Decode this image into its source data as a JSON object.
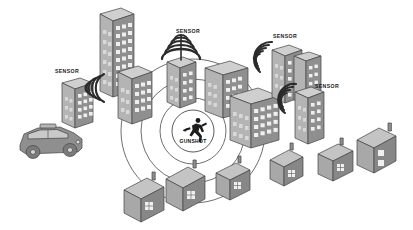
{
  "figure": {
    "background_color": "#ffffff",
    "stroke_color": "#3f3f3f",
    "fill_mid": "#9a9a9a",
    "fill_light": "#c2c2c2",
    "fill_dark": "#7d7d7d",
    "width": 413,
    "height": 230
  },
  "center_event": {
    "label": "GUNSHOT",
    "icon": "running-figure-icon",
    "x": 193,
    "y": 131,
    "badge_radius": 21
  },
  "ripples": {
    "count": 4,
    "radii": [
      21,
      33,
      52,
      72
    ],
    "center_x": 193,
    "center_y": 131
  },
  "sensors": [
    {
      "id": "sensor-left",
      "label": "SENSOR",
      "label_x": 55,
      "label_y": 71,
      "node_x": 100,
      "node_y": 87,
      "wave_direction": "left",
      "waves": 5,
      "type": "wave-fan"
    },
    {
      "id": "sensor-top-center",
      "label": "SENSOR",
      "label_x": 176,
      "label_y": 31,
      "node_x": 179,
      "node_y": 57,
      "wave_direction": "up",
      "waves": 5,
      "type": "dome"
    },
    {
      "id": "sensor-top-right",
      "label": "SENSOR",
      "label_x": 273,
      "label_y": 36,
      "node_x": 268,
      "node_y": 56,
      "wave_direction": "left",
      "waves": 5,
      "type": "wave-fan"
    },
    {
      "id": "sensor-right",
      "label": "SENSOR",
      "label_x": 315,
      "label_y": 86,
      "node_x": 291,
      "node_y": 98,
      "wave_direction": "left",
      "waves": 4,
      "type": "wave-fan"
    }
  ],
  "buildings": [
    {
      "id": "tower-tall-left",
      "kind": "office-tower",
      "floors": 10,
      "cols": 3
    },
    {
      "id": "tower-left-a",
      "kind": "office-tower",
      "floors": 6,
      "cols": 3
    },
    {
      "id": "tower-left-b",
      "kind": "office-tower",
      "floors": 6,
      "cols": 3
    },
    {
      "id": "tower-mid-a",
      "kind": "office-tower",
      "floors": 7,
      "cols": 3
    },
    {
      "id": "tower-mid-b",
      "kind": "office-tower",
      "floors": 5,
      "cols": 4
    },
    {
      "id": "tower-mid-c",
      "kind": "office-tower",
      "floors": 6,
      "cols": 4
    },
    {
      "id": "tower-right-a",
      "kind": "office-tower",
      "floors": 6,
      "cols": 3
    },
    {
      "id": "tower-right-b",
      "kind": "office-tower",
      "floors": 6,
      "cols": 3
    },
    {
      "id": "tower-right-c",
      "kind": "office-tower",
      "floors": 6,
      "cols": 3
    }
  ],
  "houses": [
    {
      "id": "house-bottom-left",
      "kind": "house",
      "chimney": true
    },
    {
      "id": "house-bottom-center",
      "kind": "house",
      "chimney": true
    },
    {
      "id": "house-bottom-right",
      "kind": "house",
      "chimney": true
    },
    {
      "id": "house-right-1",
      "kind": "house",
      "chimney": true
    },
    {
      "id": "house-right-2",
      "kind": "house",
      "chimney": true
    },
    {
      "id": "house-right-3",
      "kind": "house",
      "chimney": true
    }
  ],
  "vehicle": {
    "id": "police-car",
    "kind": "police-car",
    "light_bar": true,
    "x": 48,
    "y": 140
  }
}
